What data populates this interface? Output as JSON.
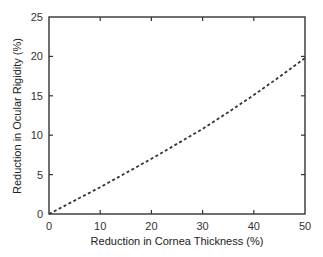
{
  "chart_data": {
    "type": "line",
    "title": "",
    "xlabel": "Reduction in Cornea Thickness (%)",
    "ylabel": "Reduction in Ocular Rigidity (%)",
    "xlim": [
      0,
      50
    ],
    "ylim": [
      0,
      25
    ],
    "xticks": [
      0,
      10,
      20,
      30,
      40,
      50
    ],
    "yticks": [
      0,
      5,
      10,
      15,
      20,
      25
    ],
    "grid": false,
    "legend": null,
    "series": [
      {
        "name": "ocular-rigidity-reduction",
        "style": "dashed",
        "color": "#333333",
        "x": [
          0,
          5,
          10,
          15,
          20,
          25,
          30,
          35,
          40,
          45,
          50
        ],
        "y": [
          0,
          1.7,
          3.4,
          5.2,
          7.0,
          8.9,
          10.8,
          12.9,
          15.1,
          17.4,
          19.8
        ]
      }
    ]
  }
}
